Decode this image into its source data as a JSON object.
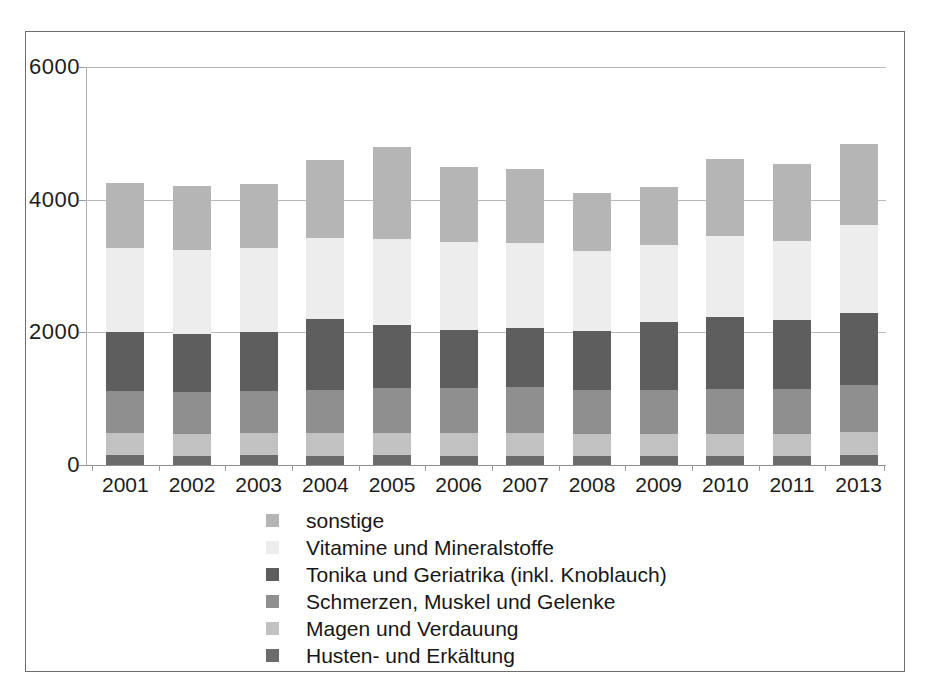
{
  "chart_data": {
    "type": "bar",
    "stacked": true,
    "title": "",
    "subtitle": "",
    "xlabel": "",
    "ylabel": "",
    "categories": [
      "2001",
      "2002",
      "2003",
      "2004",
      "2005",
      "2006",
      "2007",
      "2008",
      "2009",
      "2010",
      "2011",
      "2013"
    ],
    "ylim": [
      0,
      6000
    ],
    "yticks": [
      0,
      2000,
      4000,
      6000
    ],
    "ytick_labels": [
      "0",
      "2000",
      "4000",
      "6000"
    ],
    "grid": true,
    "grid_axis": "y",
    "legend_position": "bottom",
    "series": [
      {
        "name": "Husten- und Erkältung",
        "color": "#6b6b6b",
        "values": [
          150,
          140,
          150,
          140,
          150,
          140,
          140,
          130,
          140,
          140,
          140,
          150
        ]
      },
      {
        "name": "Magen und Verdauung",
        "color": "#c2c2c2",
        "values": [
          330,
          330,
          340,
          340,
          340,
          350,
          350,
          340,
          330,
          330,
          330,
          350
        ]
      },
      {
        "name": "Schmerzen, Muskel und Gelenke",
        "color": "#8f8f8f",
        "values": [
          630,
          630,
          630,
          650,
          670,
          670,
          680,
          660,
          660,
          680,
          680,
          700
        ]
      },
      {
        "name": "Tonika und Geriatrika (inkl. Knoblauch)",
        "color": "#5e5e5e",
        "values": [
          900,
          880,
          890,
          1070,
          950,
          880,
          890,
          890,
          1030,
          1080,
          1040,
          1090
        ]
      },
      {
        "name": "Vitamine und Mineralstoffe",
        "color": "#ededed",
        "values": [
          1260,
          1260,
          1260,
          1220,
          1300,
          1320,
          1290,
          1200,
          1160,
          1220,
          1190,
          1330
        ]
      },
      {
        "name": "sonstige",
        "color": "#b5b5b5",
        "values": [
          980,
          960,
          960,
          1180,
          1380,
          1140,
          1120,
          880,
          870,
          1160,
          1160,
          1220
        ]
      }
    ],
    "totals": [
      4250,
      4200,
      4230,
      4600,
      4790,
      4500,
      4470,
      4100,
      4190,
      4610,
      4540,
      4840
    ]
  },
  "legend": {
    "items": [
      {
        "label": "sonstige",
        "color": "#b5b5b5"
      },
      {
        "label": "Vitamine und Mineralstoffe",
        "color": "#ededed"
      },
      {
        "label": "Tonika und Geriatrika (inkl. Knoblauch)",
        "color": "#5e5e5e"
      },
      {
        "label": "Schmerzen, Muskel und Gelenke",
        "color": "#8f8f8f"
      },
      {
        "label": "Magen und Verdauung",
        "color": "#c2c2c2"
      },
      {
        "label": "Husten- und Erkältung",
        "color": "#6b6b6b"
      }
    ]
  }
}
